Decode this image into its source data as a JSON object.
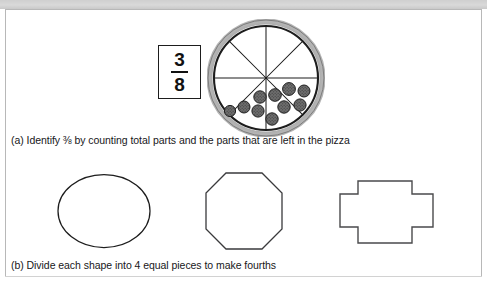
{
  "figure": {
    "background_color": "#ffffff",
    "border_color": "#b8b8b8",
    "band_color": "#cfcfcf",
    "ink_color": "#1d1d1d"
  },
  "panel_a": {
    "label": "(a)",
    "caption": "(a) Identify ⅜ by counting total parts and the parts that are left in the pizza",
    "fraction": {
      "numerator": "3",
      "denominator": "8",
      "display": "3/8"
    },
    "pizza": {
      "total_slices": 8,
      "slices_with_topping": 3,
      "topping_count": 10,
      "topping_name": "pepperoni",
      "crust_color": "#8a8a8a",
      "cheese_color": "#ffffff",
      "cut_line_color": "#1d1d1d"
    }
  },
  "panel_b": {
    "label": "(b)",
    "caption": "(b) Divide each shape into 4 equal pieces to make fourths",
    "target_parts": "4",
    "shapes": [
      {
        "name": "ellipse",
        "label": "ellipse",
        "sides": "0"
      },
      {
        "name": "octagon",
        "label": "octagon",
        "sides": "8"
      },
      {
        "name": "cross",
        "label": "cross",
        "sides": "12"
      }
    ]
  }
}
